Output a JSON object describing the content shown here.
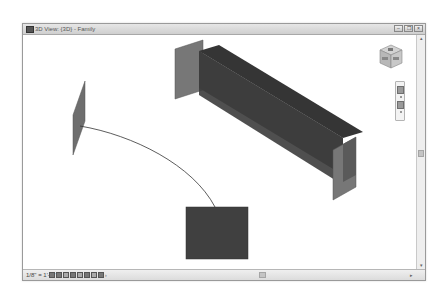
{
  "window": {
    "title": "3D View: {3D} - Family",
    "controls": {
      "minimize": "–",
      "restore": "❐",
      "close": "×"
    }
  },
  "statusbar": {
    "scale": "1/8\" = 1'-0\"",
    "tool_icons": [
      "detail-level-icon",
      "visual-style-icon",
      "sun-path-icon",
      "shadows-icon",
      "crop-view-icon",
      "show-crop-icon",
      "temporary-hide-icon",
      "reveal-hidden-icon",
      "more-icon"
    ]
  },
  "navigation": {
    "viewcube_label": "ViewCube",
    "steering_wheel_icon": "steering-wheel-icon",
    "zoom_icon": "zoom-icon"
  },
  "model": {
    "colors": {
      "plane_fill": "#6e6e6e",
      "beam_fill": "#3a3a3a",
      "beam_side": "#4e4e4e",
      "square_fill": "#404040",
      "curve_stroke": "#333333"
    },
    "elements": [
      "reference-plane-left",
      "swept-path-curve",
      "profile-square",
      "extrusion-beam",
      "end-plane-top-left",
      "end-plane-bottom-right"
    ]
  }
}
